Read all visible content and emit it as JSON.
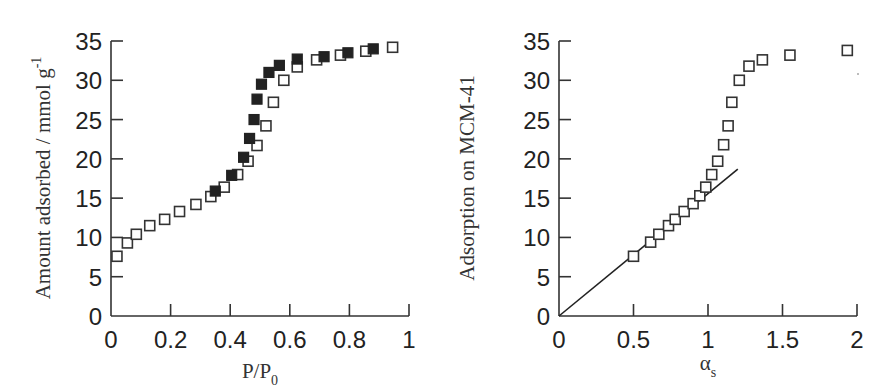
{
  "chart_data": [
    {
      "type": "scatter",
      "title": "",
      "xlabel": "P/P",
      "xlabel_subscript": "0",
      "ylabel": "Amount adsorbed / mmol g",
      "ylabel_superscript": "-1",
      "xlim": [
        0,
        1
      ],
      "ylim": [
        0,
        35
      ],
      "xticks": [
        "0",
        "0.2",
        "0.4",
        "0.6",
        "0.8",
        "1"
      ],
      "yticks": [
        "0",
        "5",
        "10",
        "15",
        "20",
        "25",
        "30",
        "35"
      ],
      "grid": false,
      "legend": "none",
      "series": [
        {
          "name": "adsorption (open squares)",
          "marker": "open-square",
          "x": [
            0.02,
            0.055,
            0.085,
            0.13,
            0.18,
            0.23,
            0.285,
            0.335,
            0.38,
            0.425,
            0.46,
            0.49,
            0.52,
            0.545,
            0.58,
            0.625,
            0.69,
            0.77,
            0.855,
            0.945
          ],
          "y": [
            7.6,
            9.3,
            10.4,
            11.5,
            12.3,
            13.3,
            14.2,
            15.2,
            16.4,
            18.0,
            19.7,
            21.7,
            24.2,
            27.2,
            30.0,
            31.7,
            32.6,
            33.2,
            33.7,
            34.2
          ]
        },
        {
          "name": "desorption (filled squares)",
          "marker": "filled-square",
          "x": [
            0.35,
            0.405,
            0.445,
            0.465,
            0.48,
            0.49,
            0.505,
            0.53,
            0.565,
            0.625,
            0.715,
            0.795,
            0.88
          ],
          "y": [
            15.9,
            17.9,
            20.2,
            22.6,
            25.0,
            27.6,
            29.5,
            31.0,
            31.9,
            32.7,
            33.0,
            33.5,
            34.0
          ]
        }
      ]
    },
    {
      "type": "scatter",
      "title": "",
      "xlabel": "α",
      "xlabel_subscript": "s",
      "ylabel": "Adsorption on MCM-41",
      "xlim": [
        0,
        2
      ],
      "ylim": [
        0,
        35
      ],
      "xticks": [
        "0",
        "0.5",
        "1",
        "1.5",
        "2"
      ],
      "yticks": [
        "0",
        "5",
        "10",
        "15",
        "20",
        "25",
        "30",
        "35"
      ],
      "grid": false,
      "legend": "none",
      "series": [
        {
          "name": "alpha-s plot (open squares)",
          "marker": "open-square",
          "x": [
            0.5,
            0.615,
            0.67,
            0.735,
            0.78,
            0.84,
            0.9,
            0.945,
            0.985,
            1.025,
            1.065,
            1.105,
            1.135,
            1.16,
            1.21,
            1.275,
            1.365,
            1.55,
            1.935
          ],
          "y": [
            7.6,
            9.4,
            10.4,
            11.5,
            12.3,
            13.3,
            14.3,
            15.3,
            16.4,
            18.0,
            19.7,
            21.8,
            24.2,
            27.2,
            30.0,
            31.8,
            32.6,
            33.2,
            33.8
          ]
        },
        {
          "name": "linear fit",
          "type": "line",
          "x": [
            0,
            1.2
          ],
          "y": [
            0,
            18.7
          ]
        }
      ]
    }
  ]
}
